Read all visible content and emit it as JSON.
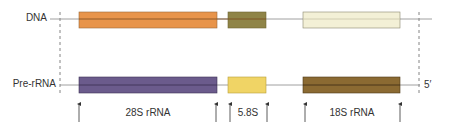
{
  "diagram": {
    "rows": {
      "dna": {
        "label": "DNA"
      },
      "pre_rrna": {
        "label": "Pre-rRNA",
        "end_label": "5′"
      }
    },
    "segments": [
      {
        "id": "28s",
        "name": "28S rRNA",
        "dna_color": "#e8944a",
        "rna_color": "#6b5b8c"
      },
      {
        "id": "5_8s",
        "name": "5.8S",
        "dna_color": "#8f8447",
        "rna_color": "#f0d465"
      },
      {
        "id": "18s",
        "name": "18S rRNA",
        "dna_color": "#f3f0d6",
        "rna_color": "#8b6a32"
      }
    ],
    "colors": {
      "line": "#888888",
      "arrow": "#333333",
      "dashed": "#666666"
    }
  }
}
